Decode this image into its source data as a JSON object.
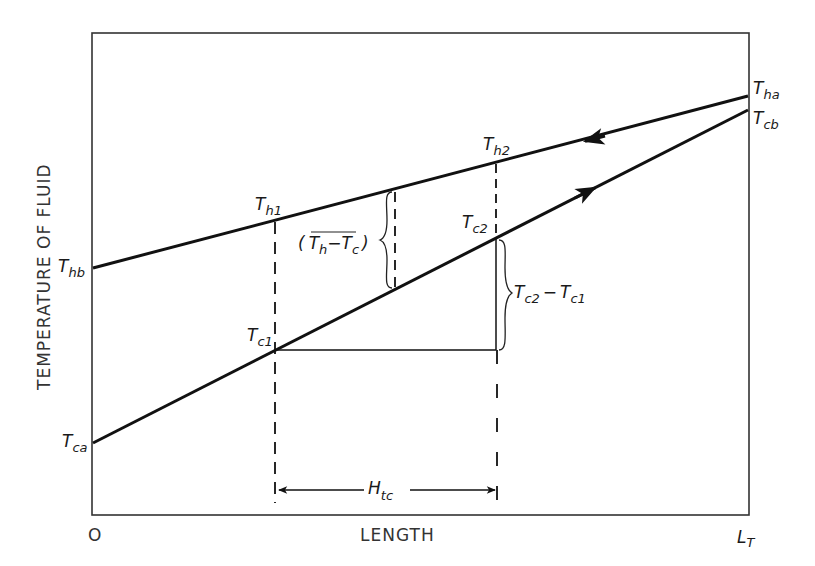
{
  "diagram": {
    "type": "counter-current heat exchanger temperature profile",
    "axes": {
      "ylabel": "TEMPERATURE OF FLUID",
      "xlabel": "LENGTH",
      "x_origin_label": "O",
      "x_end_label": {
        "main": "L",
        "sub": "T"
      }
    },
    "lines": {
      "hot": {
        "name": "hot fluid",
        "start_label": {
          "main": "T",
          "sub": "hb"
        },
        "end_label": {
          "main": "T",
          "sub": "ha"
        },
        "flow_direction": "right-to-left"
      },
      "cold": {
        "name": "cold fluid",
        "start_label": {
          "main": "T",
          "sub": "ca"
        },
        "end_label": {
          "main": "T",
          "sub": "cb"
        },
        "flow_direction": "left-to-right"
      }
    },
    "points": {
      "th1": {
        "main": "T",
        "sub": "h1"
      },
      "th2": {
        "main": "T",
        "sub": "h2"
      },
      "tc1": {
        "main": "T",
        "sub": "c1"
      },
      "tc2": {
        "main": "T",
        "sub": "c2"
      }
    },
    "annotations": {
      "mean_diff": {
        "open": "(",
        "t1": "T",
        "s1": "h",
        "minus": "−",
        "t2": "T",
        "s2": "c",
        "close": ")"
      },
      "rise": {
        "t1": "T",
        "s1": "c2",
        "minus": "−",
        "t2": "T",
        "s2": "c1"
      },
      "htu": {
        "main": "H",
        "sub": "tc"
      }
    },
    "colors": {
      "line": "#111111",
      "frame": "#333333",
      "background": "#ffffff"
    }
  }
}
